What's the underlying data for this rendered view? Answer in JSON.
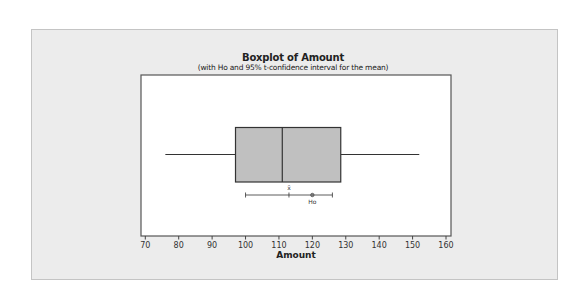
{
  "chart_data": {
    "type": "boxplot",
    "title": "Boxplot of Amount",
    "subtitle": "(with Ho and 95% t-confidence interval for the mean)",
    "xlabel": "Amount",
    "ylabel": "",
    "xlim": [
      69,
      161
    ],
    "x_ticks": [
      70,
      80,
      90,
      100,
      110,
      120,
      130,
      140,
      150,
      160
    ],
    "orientation": "horizontal",
    "grid": false,
    "box": {
      "whisker_low": 76,
      "q1": 97,
      "median": 111,
      "q3": 128.5,
      "whisker_high": 152
    },
    "mean_ci": {
      "mean": 113,
      "ci_low": 100,
      "ci_high": 126,
      "confidence": "95%",
      "mean_label": "x̄"
    },
    "hypothesized_mean": {
      "value": 120,
      "label": "Ho"
    }
  },
  "colors": {
    "panel_bg": "#ececec",
    "plot_bg": "#ffffff",
    "box_fill": "#c0c0c0",
    "line": "#333333"
  }
}
